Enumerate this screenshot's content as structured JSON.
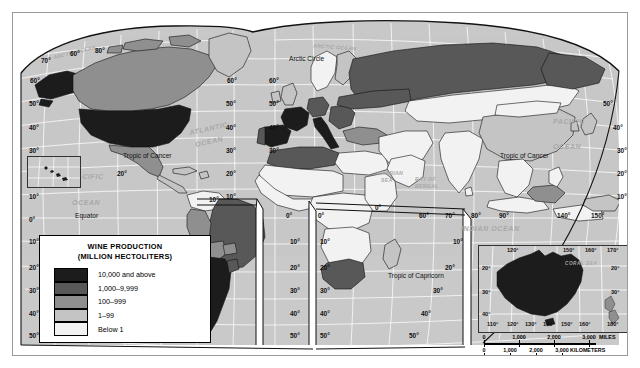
{
  "map": {
    "title": "World Wine Production Map",
    "projection_note": "MODIFIED GOODE'S HOMOLOSINE EQUAL-AREA PROJECTION",
    "ocean_color": "#c9c9c9",
    "graticule_color": "#ffffff",
    "border_color": "#1a1a1a"
  },
  "legend": {
    "title_line1": "WINE PRODUCTION",
    "title_line2": "(MILLION HECTOLITERS)",
    "classes": [
      {
        "label": "10,000 and above",
        "color": "#1c1c1c"
      },
      {
        "label": "1,000–9,999",
        "color": "#585858"
      },
      {
        "label": "100–999",
        "color": "#8f8f8f"
      },
      {
        "label": "1–99",
        "color": "#c4c4c4"
      },
      {
        "label": "Below 1",
        "color": "#f2f2f2"
      }
    ]
  },
  "ocean_labels": [
    {
      "text": "ARCTIC OCEAN",
      "x": 40,
      "y": 37,
      "rot": -14,
      "size": "sm"
    },
    {
      "text": "ARCTIC OCEAN",
      "x": 300,
      "y": 32,
      "rot": 4,
      "size": "sm"
    },
    {
      "text": "ATLANTIC",
      "x": 176,
      "y": 112,
      "rot": -12,
      "size": ""
    },
    {
      "text": "OCEAN",
      "x": 182,
      "y": 125,
      "rot": -12,
      "size": ""
    },
    {
      "text": "PACIFIC",
      "x": 59,
      "y": 160,
      "rot": 0,
      "size": ""
    },
    {
      "text": "OCEAN",
      "x": 59,
      "y": 186,
      "rot": 0,
      "size": ""
    },
    {
      "text": "PACIFIC",
      "x": 540,
      "y": 105,
      "rot": 0,
      "size": ""
    },
    {
      "text": "OCEAN",
      "x": 540,
      "y": 130,
      "rot": 0,
      "size": ""
    },
    {
      "text": "INDIAN OCEAN",
      "x": 448,
      "y": 212,
      "rot": 0,
      "size": ""
    },
    {
      "text": "BAY OF",
      "x": 402,
      "y": 166,
      "rot": 0,
      "size": "sm"
    },
    {
      "text": "BENGAL",
      "x": 402,
      "y": 172,
      "rot": 0,
      "size": "sm"
    },
    {
      "text": "ARABIAN",
      "x": 366,
      "y": 160,
      "rot": 0,
      "size": "sm"
    },
    {
      "text": "SEA",
      "x": 370,
      "y": 166,
      "rot": 0,
      "size": "sm"
    }
  ],
  "geo_lines": [
    {
      "text": "Arctic Circle",
      "x": 276,
      "y": 47
    },
    {
      "text": "Tropic of Cancer",
      "x": 186,
      "y": 143
    },
    {
      "text": "Tropic of Cancer",
      "x": 487,
      "y": 143
    },
    {
      "text": "Equator",
      "x": 62,
      "y": 205
    },
    {
      "text": "Tropic of Capricorn",
      "x": 375,
      "y": 265
    }
  ],
  "latitude_labels_left": [
    "70°",
    "60°",
    "50°",
    "40°",
    "30°",
    "20°",
    "10°",
    "0°",
    "10°",
    "20°",
    "30°",
    "40°",
    "50°"
  ],
  "lat_left_positions": [
    {
      "t": "70°",
      "x": 28,
      "y": 45
    },
    {
      "t": "60°",
      "x": 17,
      "y": 65
    },
    {
      "t": "50°",
      "x": 16,
      "y": 88
    },
    {
      "t": "40°",
      "x": 16,
      "y": 112
    },
    {
      "t": "30°",
      "x": 16,
      "y": 135
    },
    {
      "t": "20°",
      "x": 16,
      "y": 158
    },
    {
      "t": "160°",
      "x": 14,
      "y": 164
    },
    {
      "t": "10°",
      "x": 16,
      "y": 181
    },
    {
      "t": "0°",
      "x": 16,
      "y": 204
    },
    {
      "t": "10°",
      "x": 16,
      "y": 226
    },
    {
      "t": "20°",
      "x": 16,
      "y": 252
    },
    {
      "t": "30°",
      "x": 16,
      "y": 275
    },
    {
      "t": "40°",
      "x": 16,
      "y": 298
    },
    {
      "t": "50°",
      "x": 16,
      "y": 320
    }
  ],
  "lat_labels_misc": [
    {
      "t": "80°",
      "x": 82,
      "y": 35
    },
    {
      "t": "60°",
      "x": 57,
      "y": 38
    },
    {
      "t": "60°",
      "x": 214,
      "y": 65
    },
    {
      "t": "50°",
      "x": 213,
      "y": 88
    },
    {
      "t": "40°",
      "x": 213,
      "y": 112
    },
    {
      "t": "30°",
      "x": 213,
      "y": 135
    },
    {
      "t": "20°",
      "x": 213,
      "y": 158
    },
    {
      "t": "10°",
      "x": 213,
      "y": 181
    },
    {
      "t": "20°",
      "x": 104,
      "y": 158
    },
    {
      "t": "60°",
      "x": 256,
      "y": 65
    },
    {
      "t": "50°",
      "x": 256,
      "y": 88
    },
    {
      "t": "40°",
      "x": 256,
      "y": 112
    },
    {
      "t": "30°",
      "x": 256,
      "y": 135
    },
    {
      "t": "0°",
      "x": 305,
      "y": 200
    },
    {
      "t": "10°",
      "x": 307,
      "y": 226
    },
    {
      "t": "20°",
      "x": 307,
      "y": 252
    },
    {
      "t": "30°",
      "x": 307,
      "y": 275
    },
    {
      "t": "40°",
      "x": 307,
      "y": 298
    },
    {
      "t": "50°",
      "x": 307,
      "y": 320
    },
    {
      "t": "0°",
      "x": 273,
      "y": 200
    },
    {
      "t": "10°",
      "x": 277,
      "y": 226
    },
    {
      "t": "20°",
      "x": 277,
      "y": 252
    },
    {
      "t": "30°",
      "x": 277,
      "y": 275
    },
    {
      "t": "40°",
      "x": 277,
      "y": 298
    },
    {
      "t": "50°",
      "x": 277,
      "y": 320
    },
    {
      "t": "50°",
      "x": 590,
      "y": 88
    },
    {
      "t": "40°",
      "x": 600,
      "y": 112
    },
    {
      "t": "30°",
      "x": 604,
      "y": 135
    },
    {
      "t": "20°",
      "x": 604,
      "y": 158
    },
    {
      "t": "10°",
      "x": 604,
      "y": 181
    },
    {
      "t": "20°",
      "x": 432,
      "y": 252
    },
    {
      "t": "30°",
      "x": 420,
      "y": 275
    },
    {
      "t": "40°",
      "x": 408,
      "y": 298
    },
    {
      "t": "50°",
      "x": 396,
      "y": 320
    },
    {
      "t": "10°",
      "x": 440,
      "y": 226
    }
  ],
  "lon_labels": [
    {
      "t": "0°",
      "x": 362,
      "y": 192
    },
    {
      "t": "10°",
      "x": 196,
      "y": 184
    },
    {
      "t": "60°",
      "x": 406,
      "y": 200
    },
    {
      "t": "70°",
      "x": 432,
      "y": 200
    },
    {
      "t": "80°",
      "x": 458,
      "y": 200
    },
    {
      "t": "90°",
      "x": 486,
      "y": 200
    },
    {
      "t": "140°",
      "x": 544,
      "y": 200
    },
    {
      "t": "150°",
      "x": 578,
      "y": 200
    }
  ],
  "hawaii_inset": {
    "label": "160°"
  },
  "australia_inset": {
    "sea_label": "CORAL SEA",
    "lon_top": [
      "120°",
      "150°",
      "160°",
      "170°"
    ],
    "lon_bottom": [
      "110°",
      "120°",
      "130°",
      "140°",
      "150°",
      "160°",
      "180°"
    ],
    "lat_left": [
      "20°",
      "30°",
      "40°"
    ],
    "lat_right": [
      "20°",
      "30°"
    ]
  },
  "scale_miles": {
    "unit": "MILES",
    "ticks": [
      "0",
      "1,000",
      "2,000",
      "3,000"
    ]
  },
  "scale_km": {
    "unit": "KILOMETERS",
    "ticks": [
      "0",
      "1,000",
      "2,000",
      "3,000"
    ]
  },
  "chart_data": {
    "type": "map",
    "title": "WINE PRODUCTION (MILLION HECTOLITERS)",
    "classification": "choropleth, 5 classes",
    "classes": [
      "10,000 and above",
      "1,000–9,999",
      "100–999",
      "1–99",
      "Below 1"
    ],
    "countries": [
      {
        "name": "United States",
        "class": "10,000 and above"
      },
      {
        "name": "France",
        "class": "10,000 and above"
      },
      {
        "name": "Spain",
        "class": "10,000 and above"
      },
      {
        "name": "Italy",
        "class": "10,000 and above"
      },
      {
        "name": "Argentina",
        "class": "10,000 and above"
      },
      {
        "name": "Chile",
        "class": "10,000 and above"
      },
      {
        "name": "Australia",
        "class": "10,000 and above"
      },
      {
        "name": "Portugal",
        "class": "1,000–9,999"
      },
      {
        "name": "Germany",
        "class": "1,000–9,999"
      },
      {
        "name": "Romania",
        "class": "1,000–9,999"
      },
      {
        "name": "Russia",
        "class": "1,000–9,999"
      },
      {
        "name": "Canada",
        "class": "100–999"
      },
      {
        "name": "Brazil",
        "class": "1,000–9,999"
      },
      {
        "name": "South Africa",
        "class": "1,000–9,999"
      },
      {
        "name": "Algeria",
        "class": "1,000–9,999"
      },
      {
        "name": "China",
        "class": "1–99"
      },
      {
        "name": "New Zealand",
        "class": "100–999"
      }
    ]
  }
}
